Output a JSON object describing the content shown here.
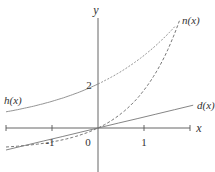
{
  "chart_data": {
    "type": "line",
    "title": "",
    "xlabel": "x",
    "ylabel": "y",
    "xlim": [
      -2.0,
      2.0
    ],
    "ylim": [
      -2.0,
      5.0
    ],
    "grid": false,
    "legend": "inline labels at curve ends",
    "x_ticks": [
      -1,
      1
    ],
    "x_tick_labels": [
      "-1",
      "1"
    ],
    "y_annotations": [
      {
        "y": 2,
        "label": "2"
      }
    ],
    "origin_label": "0",
    "series": [
      {
        "name": "h(x)",
        "label": "h(x)",
        "style": "solid-left / dotted-right",
        "formula_estimate": "2*exp(0.5x)",
        "x": [
          -2.0,
          -1.0,
          0.0,
          1.0,
          1.65
        ],
        "y": [
          0.74,
          1.21,
          2.0,
          3.3,
          4.56
        ]
      },
      {
        "name": "n(x)",
        "label": "n(x)",
        "style": "dashed",
        "formula_estimate": "exp(x)-1",
        "x": [
          -2.0,
          -1.0,
          0.0,
          1.0,
          1.75
        ],
        "y": [
          -0.86,
          -0.63,
          0.0,
          1.72,
          4.75
        ]
      },
      {
        "name": "d(x)",
        "label": "d(x)",
        "style": "solid",
        "formula_estimate": "0.5x",
        "x": [
          -2.0,
          0.0,
          2.07
        ],
        "y": [
          -1.0,
          0.0,
          1.03
        ]
      }
    ]
  },
  "labels": {
    "y_axis": "y",
    "x_axis": "x",
    "tick_neg1": "-1",
    "tick_1": "1",
    "origin": "0",
    "y_two": "2",
    "h": "h(x)",
    "n": "n(x)",
    "d": "d(x)"
  },
  "colors": {
    "axis": "#555555",
    "curve": "#777777",
    "text": "#333333"
  }
}
